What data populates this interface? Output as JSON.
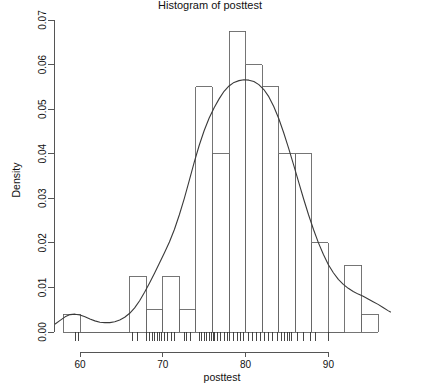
{
  "chart_data": {
    "type": "bar",
    "title": "Histogram of posttest",
    "xlabel": "posttest",
    "ylabel": "Density",
    "xlim": [
      57.0,
      97.5
    ],
    "ylim": [
      0.0,
      0.0715
    ],
    "xticks": [
      60,
      70,
      80,
      90
    ],
    "xticklabels": [
      "60",
      "70",
      "80",
      "90"
    ],
    "yticks": [
      0.0,
      0.01,
      0.02,
      0.03,
      0.04,
      0.05,
      0.06,
      0.07
    ],
    "yticklabels": [
      "0.00",
      "0.01",
      "0.02",
      "0.03",
      "0.04",
      "0.05",
      "0.06",
      "0.07"
    ],
    "grid": false,
    "legend": false,
    "binwidth": 2,
    "bin_edges": [
      58,
      60,
      62,
      64,
      66,
      68,
      70,
      72,
      74,
      76,
      78,
      80,
      82,
      84,
      86,
      88,
      90,
      92,
      94,
      96
    ],
    "categories": [
      "58-60",
      "60-62",
      "62-64",
      "64-66",
      "66-68",
      "68-70",
      "70-72",
      "72-74",
      "74-76",
      "76-78",
      "78-80",
      "80-82",
      "82-84",
      "84-86",
      "86-88",
      "88-90",
      "90-92",
      "92-94",
      "94-96"
    ],
    "values": [
      0.004,
      0.0,
      0.0,
      0.0,
      0.0125,
      0.005,
      0.0125,
      0.005,
      0.055,
      0.04,
      0.0675,
      0.06,
      0.055,
      0.04,
      0.04,
      0.02,
      0.0,
      0.015,
      0.004
    ],
    "density_curve": {
      "name": "kernel density estimate",
      "x": [
        57.0,
        57.6,
        58.2,
        58.8,
        59.4,
        60.0,
        60.6,
        61.2,
        61.8,
        62.4,
        63.0,
        63.6,
        64.2,
        64.8,
        65.4,
        66.0,
        66.6,
        67.2,
        67.8,
        68.4,
        69.0,
        69.6,
        70.2,
        70.8,
        71.4,
        72.0,
        72.6,
        73.2,
        73.8,
        74.4,
        75.0,
        75.6,
        76.2,
        76.8,
        77.4,
        78.0,
        78.6,
        79.2,
        79.8,
        80.4,
        81.0,
        81.6,
        82.2,
        82.8,
        83.4,
        84.0,
        84.6,
        85.2,
        85.8,
        86.4,
        87.0,
        87.6,
        88.2,
        88.8,
        89.4,
        90.0,
        90.6,
        91.2,
        91.8,
        92.4,
        93.0,
        93.6,
        94.2,
        94.8,
        95.4,
        96.0,
        96.6,
        97.2,
        97.5
      ],
      "y": [
        0.0018,
        0.0026,
        0.0034,
        0.0039,
        0.004,
        0.0038,
        0.0034,
        0.0029,
        0.0025,
        0.0022,
        0.0021,
        0.0021,
        0.0023,
        0.0027,
        0.0033,
        0.0042,
        0.0054,
        0.007,
        0.0089,
        0.011,
        0.0132,
        0.0155,
        0.0178,
        0.0202,
        0.023,
        0.0263,
        0.03,
        0.034,
        0.0381,
        0.0419,
        0.0452,
        0.048,
        0.0503,
        0.0523,
        0.054,
        0.0552,
        0.056,
        0.0564,
        0.0566,
        0.0565,
        0.0562,
        0.0555,
        0.0544,
        0.0528,
        0.0506,
        0.0479,
        0.0447,
        0.0412,
        0.0375,
        0.0337,
        0.0299,
        0.0263,
        0.023,
        0.02,
        0.0174,
        0.0151,
        0.0133,
        0.0118,
        0.0107,
        0.0098,
        0.0091,
        0.0085,
        0.008,
        0.0074,
        0.0068,
        0.0062,
        0.0055,
        0.0048,
        0.0045
      ]
    },
    "rug_values": [
      59.4,
      59.8,
      66.4,
      66.9,
      68.0,
      68.4,
      68.7,
      69.0,
      69.3,
      69.6,
      69.9,
      70.2,
      70.6,
      71.0,
      71.4,
      72.6,
      72.9,
      73.3,
      74.4,
      74.7,
      75.0,
      75.3,
      75.6,
      75.9,
      76.1,
      76.3,
      76.6,
      77.0,
      77.4,
      77.8,
      78.1,
      78.5,
      79.0,
      79.4,
      79.8,
      80.3,
      80.8,
      81.3,
      81.8,
      82.3,
      82.8,
      83.3,
      83.8,
      84.3,
      84.7,
      85.0,
      85.3,
      85.6,
      86.3,
      87.0,
      87.8,
      88.5,
      90.0
    ]
  },
  "axes": {
    "y_title": "Density",
    "x_title": "posttest"
  }
}
